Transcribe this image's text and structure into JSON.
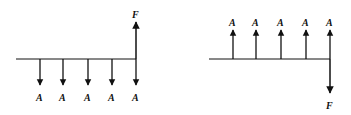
{
  "diagrams": [
    {
      "name": "series-payments-to-future",
      "series_label": "A",
      "future_label": "F",
      "series_direction": "down",
      "future_direction": "up",
      "labels": [
        "A",
        "A",
        "A",
        "A",
        "A",
        "F"
      ]
    },
    {
      "name": "series-receipts-to-future",
      "series_label": "A",
      "future_label": "F",
      "series_direction": "up",
      "future_direction": "down",
      "labels": [
        "A",
        "A",
        "A",
        "A",
        "A",
        "F"
      ]
    }
  ],
  "colors": {
    "ink": "#111111",
    "background": "#ffffff"
  }
}
